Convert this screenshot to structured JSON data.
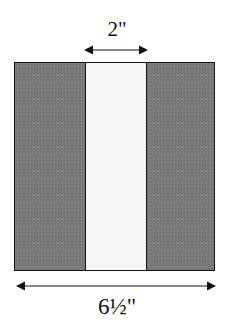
{
  "diagram": {
    "top_dimension": {
      "label": "2\"",
      "measures": "center-strip-width"
    },
    "bottom_dimension": {
      "label": "6½\"",
      "measures": "total-square-width"
    },
    "strips": [
      {
        "position": "left",
        "fill": "dark-gray"
      },
      {
        "position": "center",
        "fill": "white"
      },
      {
        "position": "right",
        "fill": "dark-gray"
      }
    ],
    "colors": {
      "dark_strip": "#7a7a7a",
      "light_strip": "#f6f6f6",
      "outline": "#111111"
    }
  }
}
